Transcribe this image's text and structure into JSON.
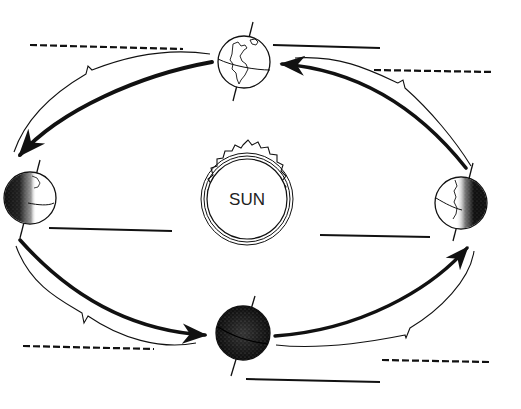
{
  "diagram": {
    "sun": {
      "label": "SUN"
    },
    "colors": {
      "ink": "#111111",
      "background": "#ffffff",
      "shade": "#1a1a1a"
    },
    "earth_positions": [
      {
        "id": "top",
        "illumination": "fully-lit",
        "blank_label_style": "solid"
      },
      {
        "id": "right",
        "illumination": "right-half-dark",
        "blank_label_style": "dashed"
      },
      {
        "id": "bottom",
        "illumination": "fully-dark",
        "blank_label_style": "solid"
      },
      {
        "id": "left",
        "illumination": "left-half-dark",
        "blank_label_style": "solid"
      }
    ],
    "orbit_arrows": [
      {
        "from": "top",
        "to": "left",
        "bracket_label_style": "dashed"
      },
      {
        "from": "left",
        "to": "bottom",
        "bracket_label_style": "dashed"
      },
      {
        "from": "bottom",
        "to": "right",
        "bracket_label_style": "dashed"
      },
      {
        "from": "right",
        "to": "top",
        "bracket_label_style": "dashed"
      }
    ],
    "blank_lines": [
      {
        "id": "top-left-dashed",
        "style": "dashed",
        "value": ""
      },
      {
        "id": "top-right-solid",
        "style": "solid",
        "value": ""
      },
      {
        "id": "right-top-dashed",
        "style": "dashed",
        "value": ""
      },
      {
        "id": "left-solid",
        "style": "solid",
        "value": ""
      },
      {
        "id": "right-solid",
        "style": "solid",
        "value": ""
      },
      {
        "id": "bottom-left-dashed",
        "style": "dashed",
        "value": ""
      },
      {
        "id": "bottom-right-dashed",
        "style": "dashed",
        "value": ""
      },
      {
        "id": "bottom-solid",
        "style": "solid",
        "value": ""
      }
    ]
  }
}
